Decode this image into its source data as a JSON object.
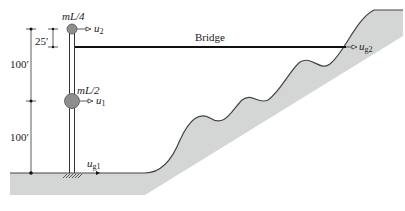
{
  "diagram": {
    "colors": {
      "ground_fill": "#d4d6d5",
      "ground_stroke": "#555555",
      "mass_fill": "#8e8e8e",
      "line": "#111111"
    },
    "labels": {
      "mass_top": "mL/4",
      "mass_mid": "mL/2",
      "u2": "u",
      "u2_sub": "2",
      "u1": "u",
      "u1_sub": "1",
      "ug1": "u",
      "ug1_sub": "g1",
      "ug2": "u",
      "ug2_sub": "g2",
      "bridge": "Bridge",
      "dim_25": "25′",
      "dim_100_upper": "100′",
      "dim_100_lower": "100′"
    }
  }
}
